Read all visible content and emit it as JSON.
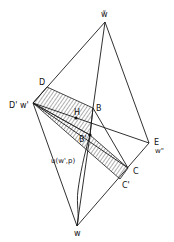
{
  "figure": {
    "type": "geometric-diagram"
  },
  "vertices": {
    "w_bar": {
      "label": "w̃",
      "x": 105,
      "y": 22
    },
    "D": {
      "label": "D",
      "x": 47,
      "y": 87
    },
    "D_prime_w_prime": {
      "label": "D' w'",
      "x": 33,
      "y": 103
    },
    "B": {
      "label": "B",
      "x": 93,
      "y": 108
    },
    "H": {
      "label": "H",
      "x": 76,
      "y": 118
    },
    "B_prime": {
      "label": "B'",
      "x": 90,
      "y": 135
    },
    "E_w_dprime": {
      "label_E": "E",
      "label_w": "w\"",
      "x": 149,
      "y": 143
    },
    "C": {
      "label": "C",
      "x": 128,
      "y": 168
    },
    "C_prime": {
      "label": "C'",
      "x": 120,
      "y": 179
    },
    "w": {
      "label": "w",
      "x": 77,
      "y": 226
    }
  },
  "labels": {
    "top": "w̃",
    "d": "D",
    "d_prime_w_prime": "D' w'",
    "b": "B",
    "h": "H",
    "b_prime": "B'",
    "e": "E",
    "w_double_prime": "w\"",
    "c": "C",
    "c_prime": "C'",
    "bottom": "w",
    "curve": "u(w',p)"
  },
  "colors": {
    "line": "#1a1a1a",
    "background": "#ffffff"
  }
}
